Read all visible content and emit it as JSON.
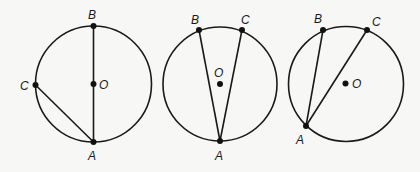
{
  "diagram": {
    "figures": [
      {
        "id": "fig1",
        "circle": {
          "cx": 93.5,
          "cy": 84,
          "r": 58
        },
        "center": {
          "label": "O",
          "x": 93.5,
          "y": 84,
          "label_x": 99,
          "label_y": 88.5
        },
        "points": [
          {
            "label": "B",
            "x": 93.5,
            "y": 26,
            "label_x": 88,
            "label_y": 19
          },
          {
            "label": "C",
            "x": 35.5,
            "y": 85,
            "label_x": 20,
            "label_y": 90
          },
          {
            "label": "A",
            "x": 93.5,
            "y": 142,
            "label_x": 88,
            "label_y": 160
          }
        ],
        "chords": [
          [
            "A",
            "B"
          ],
          [
            "A",
            "C"
          ]
        ]
      },
      {
        "id": "fig2",
        "circle": {
          "cx": 220,
          "cy": 84,
          "r": 57
        },
        "center": {
          "label": "O",
          "x": 220,
          "y": 84,
          "label_x": 214,
          "label_y": 77
        },
        "points": [
          {
            "label": "B",
            "x": 199,
            "y": 30,
            "label_x": 191,
            "label_y": 24
          },
          {
            "label": "C",
            "x": 242,
            "y": 30,
            "label_x": 241,
            "label_y": 24
          },
          {
            "label": "A",
            "x": 220,
            "y": 141,
            "label_x": 215,
            "label_y": 160
          }
        ],
        "chords": [
          [
            "A",
            "B"
          ],
          [
            "A",
            "C"
          ]
        ]
      },
      {
        "id": "fig3",
        "circle": {
          "cx": 346,
          "cy": 84,
          "r": 57.5
        },
        "center": {
          "label": "O",
          "x": 345.5,
          "y": 83.5,
          "label_x": 352,
          "label_y": 88
        },
        "points": [
          {
            "label": "B",
            "x": 323,
            "y": 30,
            "label_x": 314,
            "label_y": 23
          },
          {
            "label": "C",
            "x": 367,
            "y": 30,
            "label_x": 372,
            "label_y": 26
          },
          {
            "label": "A",
            "x": 306,
            "y": 126,
            "label_x": 296,
            "label_y": 144
          }
        ],
        "chords": [
          [
            "A",
            "B"
          ],
          [
            "A",
            "C"
          ]
        ]
      }
    ]
  }
}
